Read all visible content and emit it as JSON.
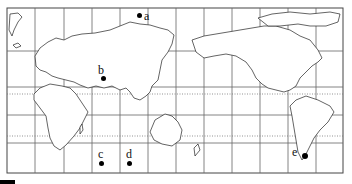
{
  "map": {
    "projection": "world map centered on Pacific (cylindrical)",
    "frame": {
      "x": 7,
      "y": 8,
      "width": 336,
      "height": 165
    },
    "grid": {
      "vertical_lines_x": [
        35,
        64,
        92,
        120,
        148,
        176,
        204,
        232,
        260,
        288,
        316
      ],
      "horizontal_lines_y": [
        51,
        87,
        115,
        143
      ],
      "dotted_lines_y": [
        94,
        136
      ],
      "line_color": "#555555"
    },
    "points": [
      {
        "label": "a",
        "dot": {
          "x": 139,
          "y": 15
        },
        "text": {
          "x": 144,
          "y": 10
        }
      },
      {
        "label": "b",
        "dot": {
          "x": 103,
          "y": 78
        },
        "text": {
          "x": 98,
          "y": 64
        }
      },
      {
        "label": "c",
        "dot": {
          "x": 101,
          "y": 163
        },
        "text": {
          "x": 98,
          "y": 148
        }
      },
      {
        "label": "d",
        "dot": {
          "x": 129,
          "y": 163
        },
        "text": {
          "x": 126,
          "y": 148
        }
      },
      {
        "label": "e",
        "dot": {
          "x": 304,
          "y": 155
        },
        "text": {
          "x": 292,
          "y": 146
        }
      }
    ]
  }
}
